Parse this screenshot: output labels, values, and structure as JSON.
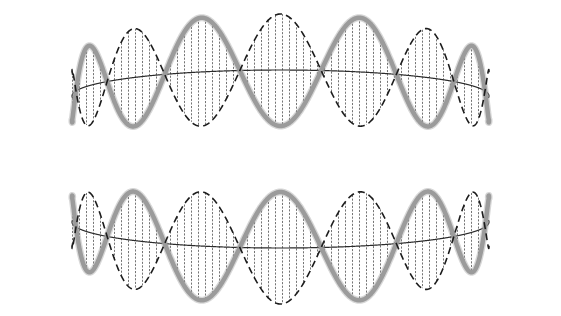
{
  "figure": {
    "background_color": "#ffffff",
    "width": 561,
    "height": 316
  },
  "geometry": {
    "center_x": 280.5,
    "cylinder_left_x": 72,
    "cylinder_right_x": 489,
    "cylinder_half_width": 208.5,
    "top_band_center_y": 96,
    "bottom_band_center_y": 222,
    "band_amplitude": 56,
    "edge_amplitude_scale": 0.42,
    "perspective_tilt": 26,
    "wrap_depth_px": 16
  },
  "chart_data": {
    "type": "line",
    "xlabel": "",
    "ylabel": "",
    "grid": false,
    "legend_position": "none",
    "x": [
      0,
      0.0625,
      0.125,
      0.1875,
      0.25,
      0.3125,
      0.375,
      0.4375,
      0.5,
      0.5625,
      0.625,
      0.6875,
      0.75,
      0.8125,
      0.875,
      0.9375,
      1
    ],
    "series": [
      {
        "name": "solid-gray-wave-top",
        "style": "solid",
        "color": "#9b9b9b",
        "width": 4.5,
        "phase_deg": 0,
        "cycles": 4,
        "band": "top",
        "values": [
          1,
          0.924,
          0.707,
          0.383,
          0,
          -0.383,
          -0.707,
          -0.924,
          -1,
          -0.924,
          -0.707,
          -0.383,
          0,
          0.383,
          0.707,
          0.924,
          1
        ]
      },
      {
        "name": "dashed-black-wave-top",
        "style": "dashed",
        "color": "#1c1c1c",
        "width": 1.6,
        "phase_deg": 180,
        "cycles": 4,
        "band": "top",
        "values": [
          -1,
          -0.924,
          -0.707,
          -0.383,
          0,
          0.383,
          0.707,
          0.924,
          1,
          0.924,
          0.707,
          0.383,
          0,
          -0.383,
          -0.707,
          -0.924,
          -1
        ]
      },
      {
        "name": "solid-gray-wave-bottom",
        "style": "solid",
        "color": "#9b9b9b",
        "width": 4.5,
        "phase_deg": 180,
        "cycles": 4,
        "band": "bottom",
        "values": [
          -1,
          -0.924,
          -0.707,
          -0.383,
          0,
          0.383,
          0.707,
          0.924,
          1,
          0.924,
          0.707,
          0.383,
          0,
          -0.383,
          -0.707,
          -0.924,
          -1
        ]
      },
      {
        "name": "dashed-black-wave-bottom",
        "style": "dashed",
        "color": "#1c1c1c",
        "width": 1.6,
        "phase_deg": 0,
        "cycles": 4,
        "band": "bottom",
        "values": [
          1,
          0.924,
          0.707,
          0.383,
          0,
          -0.383,
          -0.707,
          -0.924,
          -1,
          -0.924,
          -0.707,
          -0.383,
          0,
          0.383,
          0.707,
          0.924,
          1
        ]
      }
    ],
    "guide_curves": [
      {
        "name": "equator-arc-top",
        "color": "#2b2b2b",
        "width": 1.2,
        "sag": -26,
        "band": "top"
      },
      {
        "name": "equator-arc-bottom",
        "color": "#2b2b2b",
        "width": 1.2,
        "sag": 26,
        "band": "bottom"
      }
    ],
    "hatching": {
      "name": "vertical-hatch-fill",
      "orientation": "vertical",
      "spacing_px": 7,
      "color": "#6e6e6e",
      "width": 0.95,
      "dotted": true
    },
    "annotations": []
  },
  "elements": {
    "canvas_label": "wave-canvas",
    "node_count": 8,
    "antinode_count": 8,
    "wave_cycles": 4
  }
}
